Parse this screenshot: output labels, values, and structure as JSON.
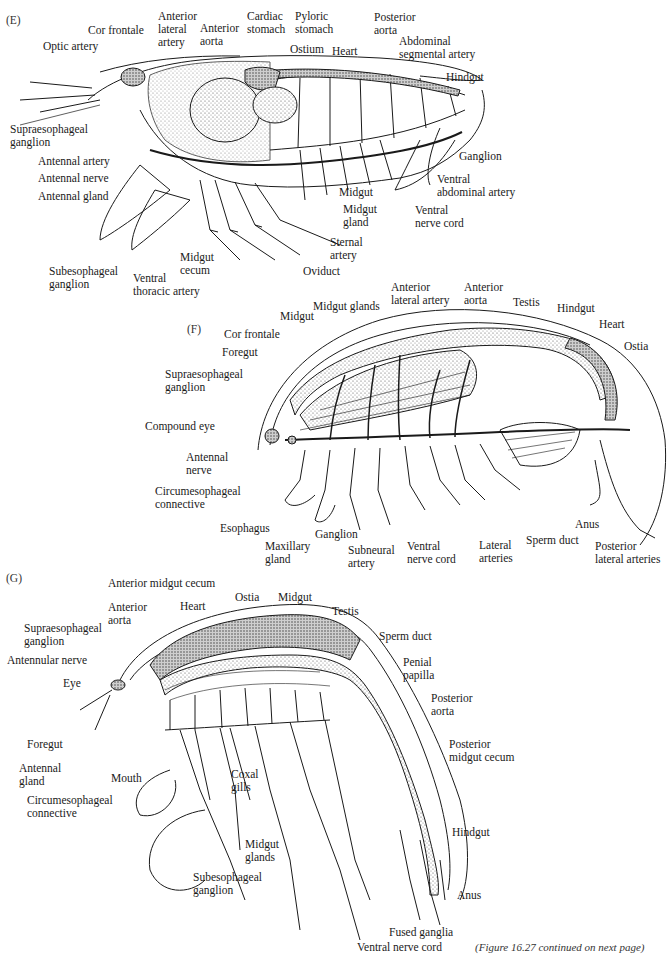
{
  "figure": {
    "caption": "(Figure 16.27 continued on next page)",
    "colors": {
      "ink": "#1a1a1a",
      "stipple": "#bdbdbd",
      "background": "#ffffff"
    }
  },
  "panels": [
    {
      "id": "E",
      "label": "(E)",
      "labels": [
        {
          "text": "Optic artery"
        },
        {
          "text": "Cor frontale"
        },
        {
          "text": "Anterior\nlateral\nartery"
        },
        {
          "text": "Anterior\naorta"
        },
        {
          "text": "Cardiac\nstomach"
        },
        {
          "text": "Pyloric\nstomach"
        },
        {
          "text": "Ostium"
        },
        {
          "text": "Heart"
        },
        {
          "text": "Posterior\naorta"
        },
        {
          "text": "Abdominal\nsegmental artery"
        },
        {
          "text": "Hindgut"
        },
        {
          "text": "Supraesophageal\nganglion"
        },
        {
          "text": "Antennal artery"
        },
        {
          "text": "Antennal nerve"
        },
        {
          "text": "Antennal gland"
        },
        {
          "text": "Ganglion"
        },
        {
          "text": "Ventral\nabdominal artery"
        },
        {
          "text": "Midgut"
        },
        {
          "text": "Midgut\ngland"
        },
        {
          "text": "Ventral\nnerve cord"
        },
        {
          "text": "Sternal\nartery"
        },
        {
          "text": "Oviduct"
        },
        {
          "text": "Midgut\ncecum"
        },
        {
          "text": "Subesophageal\nganglion"
        },
        {
          "text": "Ventral\nthoracic artery"
        }
      ]
    },
    {
      "id": "F",
      "label": "(F)",
      "labels": [
        {
          "text": "Midgut glands"
        },
        {
          "text": "Anterior\nlateral artery"
        },
        {
          "text": "Anterior\naorta"
        },
        {
          "text": "Testis"
        },
        {
          "text": "Hindgut"
        },
        {
          "text": "Heart"
        },
        {
          "text": "Ostia"
        },
        {
          "text": "Midgut"
        },
        {
          "text": "Cor frontale"
        },
        {
          "text": "Foregut"
        },
        {
          "text": "Supraesophageal\nganglion"
        },
        {
          "text": "Compound eye"
        },
        {
          "text": "Antennal\nnerve"
        },
        {
          "text": "Circumesophageal\nconnective"
        },
        {
          "text": "Esophagus"
        },
        {
          "text": "Maxillary\ngland"
        },
        {
          "text": "Ganglion"
        },
        {
          "text": "Subneural\nartery"
        },
        {
          "text": "Ventral\nnerve cord"
        },
        {
          "text": "Lateral\narteries"
        },
        {
          "text": "Sperm duct"
        },
        {
          "text": "Anus"
        },
        {
          "text": "Posterior\nlateral arteries"
        }
      ]
    },
    {
      "id": "G",
      "label": "(G)",
      "labels": [
        {
          "text": "Anterior midgut cecum"
        },
        {
          "text": "Anterior\naorta"
        },
        {
          "text": "Heart"
        },
        {
          "text": "Ostia"
        },
        {
          "text": "Midgut"
        },
        {
          "text": "Testis"
        },
        {
          "text": "Supraesophageal\nganglion"
        },
        {
          "text": "Antennular nerve"
        },
        {
          "text": "Eye"
        },
        {
          "text": "Sperm duct"
        },
        {
          "text": "Penial\npapilla"
        },
        {
          "text": "Posterior\naorta"
        },
        {
          "text": "Posterior\nmidgut cecum"
        },
        {
          "text": "Foregut"
        },
        {
          "text": "Antennal\ngland"
        },
        {
          "text": "Mouth"
        },
        {
          "text": "Circumesophageal\nconnective"
        },
        {
          "text": "Coxal\ngills"
        },
        {
          "text": "Midgut\nglands"
        },
        {
          "text": "Subesophageal\nganglion"
        },
        {
          "text": "Hindgut"
        },
        {
          "text": "Anus"
        },
        {
          "text": "Fused ganglia"
        },
        {
          "text": "Ventral nerve cord"
        }
      ]
    }
  ]
}
